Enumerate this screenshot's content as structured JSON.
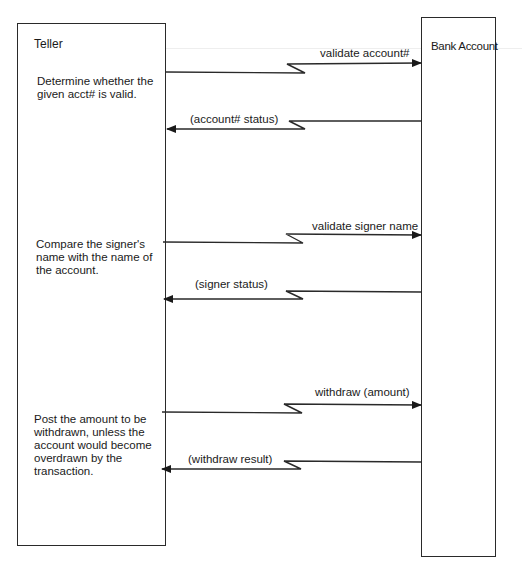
{
  "diagram": {
    "type": "sequence / interaction diagram",
    "participants": [
      {
        "id": "teller",
        "label": "Teller"
      },
      {
        "id": "bank_account",
        "label": "Bank Account"
      }
    ],
    "steps": [
      {
        "note": "Determine whether the given acct# is valid.",
        "request": "validate account#",
        "reply": "(account# status)"
      },
      {
        "note": "Compare the signer's name with the name of the account.",
        "request": "validate signer name",
        "reply": "(signer status)"
      },
      {
        "note": "Post the amount to be withdrawn, unless the account would become overdrawn by the transaction.",
        "request": "withdraw (amount)",
        "reply": "(withdraw result)"
      }
    ],
    "colors": {
      "line": "#2a2a2a",
      "background": "#ffffff",
      "text": "#1a1a1a"
    }
  }
}
